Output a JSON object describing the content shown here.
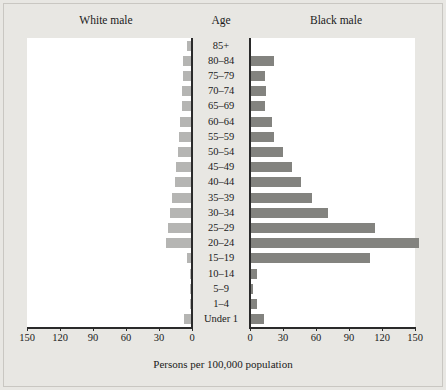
{
  "header": {
    "left_label": "White male",
    "center_label": "Age",
    "right_label": "Black male"
  },
  "axis": {
    "xlabel": "Persons per 100,000 population",
    "left_ticks": [
      "150",
      "120",
      "90",
      "60",
      "30",
      "0"
    ],
    "right_ticks": [
      "0",
      "30",
      "60",
      "90",
      "120",
      "150"
    ]
  },
  "chart_data": {
    "type": "bar",
    "title": "",
    "subtitle": "",
    "orientation": "horizontal",
    "layout": "population-pyramid",
    "xlabel": "Persons per 100,000 population",
    "ylabel": "Age",
    "xlim": [
      0,
      150
    ],
    "grid": false,
    "legend": "none",
    "colors": {
      "white_male": "#b5b5b3",
      "black_male": "#83837f",
      "axis": "#2a2a2a",
      "plot_background": "#ffffff",
      "page_background": "#e8e7e3"
    },
    "categories": [
      "85+",
      "80–84",
      "75–79",
      "70–74",
      "65–69",
      "60–64",
      "55–59",
      "50–54",
      "45–49",
      "40–44",
      "35–39",
      "30–34",
      "25–29",
      "20–24",
      "15–19",
      "10–14",
      "5–9",
      "1–4",
      "Under 1"
    ],
    "series": [
      {
        "name": "White male",
        "side": "left",
        "color": "#b5b5b3",
        "values": [
          4,
          7,
          7,
          8,
          8,
          10,
          11,
          12,
          14,
          15,
          17,
          19,
          21,
          23,
          4,
          1,
          1,
          1,
          6
        ]
      },
      {
        "name": "Black male",
        "side": "right",
        "color": "#83837f",
        "values": [
          0,
          21,
          13,
          14,
          13,
          19,
          21,
          29,
          37,
          45,
          55,
          70,
          113,
          153,
          108,
          5,
          2,
          5,
          12
        ]
      }
    ]
  }
}
